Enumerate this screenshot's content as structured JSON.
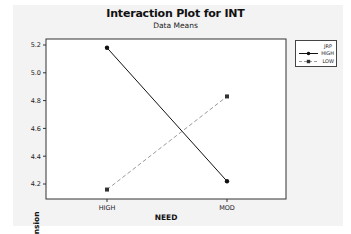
{
  "chart_data": {
    "type": "line",
    "title": "Interaction Plot for INT",
    "subtitle": "Data Means",
    "xlabel": "NEED",
    "ylabel": "Mean Intension",
    "categories": [
      "HIGH",
      "MOD"
    ],
    "series": [
      {
        "name": "HIGH",
        "values": [
          5.18,
          4.22
        ],
        "style": "solid",
        "marker": "circle",
        "color": "#111111"
      },
      {
        "name": "LOW",
        "values": [
          4.16,
          4.83
        ],
        "style": "dashed",
        "marker": "square",
        "color": "#9a9a9a"
      }
    ],
    "yticks": [
      4.2,
      4.4,
      4.6,
      4.8,
      5.0,
      5.2
    ],
    "ytick_labels": [
      "4.2",
      "4.4",
      "4.6",
      "4.8",
      "5.0",
      "5.2"
    ],
    "ylim": [
      4.1,
      5.24
    ],
    "grid": false,
    "legend": {
      "title": "JRP",
      "position": "right",
      "entries": [
        "HIGH",
        "LOW"
      ]
    }
  },
  "legend": {
    "title": "JRP",
    "items": [
      {
        "label": "HIGH"
      },
      {
        "label": "LOW"
      }
    ]
  }
}
